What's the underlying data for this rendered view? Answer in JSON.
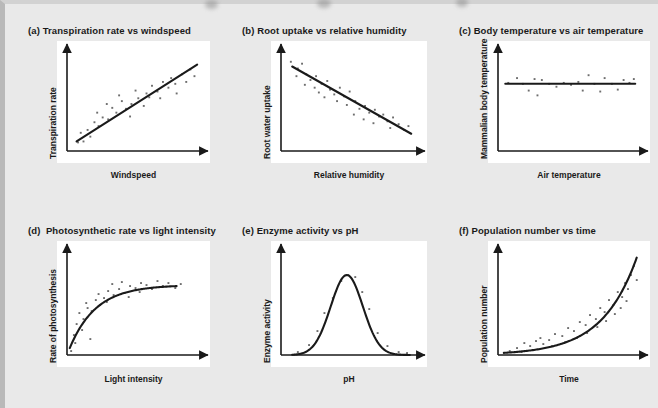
{
  "figure": {
    "background_color": "#e9e9e9",
    "panel_color": "#ffffff",
    "ink_color": "#1a1a1a",
    "point_color": "#6e6e6e"
  },
  "panels": [
    {
      "key": "a",
      "title": "(a) Transpiration rate vs windspeed",
      "xlabel": "Windspeed",
      "ylabel": "Transpiration rate",
      "chart_data": {
        "type": "scatter",
        "title": "(a) Transpiration rate vs windspeed",
        "xlabel": "Windspeed",
        "ylabel": "Transpiration rate",
        "relationship": "positive linear correlation",
        "xlim": [
          0,
          1
        ],
        "ylim": [
          0,
          1
        ],
        "grid": false,
        "legend": "none",
        "fit_line": {
          "type": "linear",
          "x": [
            0.07,
            0.95
          ],
          "y": [
            0.1,
            0.9
          ]
        },
        "points": [
          [
            0.08,
            0.09
          ],
          [
            0.12,
            0.1
          ],
          [
            0.1,
            0.19
          ],
          [
            0.15,
            0.22
          ],
          [
            0.17,
            0.15
          ],
          [
            0.2,
            0.3
          ],
          [
            0.23,
            0.26
          ],
          [
            0.26,
            0.35
          ],
          [
            0.22,
            0.4
          ],
          [
            0.3,
            0.33
          ],
          [
            0.33,
            0.45
          ],
          [
            0.29,
            0.49
          ],
          [
            0.36,
            0.4
          ],
          [
            0.4,
            0.52
          ],
          [
            0.43,
            0.44
          ],
          [
            0.38,
            0.58
          ],
          [
            0.47,
            0.49
          ],
          [
            0.46,
            0.36
          ],
          [
            0.52,
            0.55
          ],
          [
            0.5,
            0.63
          ],
          [
            0.56,
            0.47
          ],
          [
            0.58,
            0.6
          ],
          [
            0.62,
            0.68
          ],
          [
            0.6,
            0.56
          ],
          [
            0.66,
            0.62
          ],
          [
            0.7,
            0.72
          ],
          [
            0.68,
            0.55
          ],
          [
            0.74,
            0.66
          ],
          [
            0.76,
            0.76
          ],
          [
            0.8,
            0.6
          ],
          [
            0.79,
            0.7
          ],
          [
            0.84,
            0.8
          ],
          [
            0.87,
            0.72
          ],
          [
            0.9,
            0.85
          ],
          [
            0.93,
            0.78
          ]
        ]
      }
    },
    {
      "key": "b",
      "title": "(b) Root uptake vs relative humidity",
      "xlabel": "Relative humidity",
      "ylabel": "Root water uptake",
      "chart_data": {
        "type": "scatter",
        "title": "(b) Root uptake vs relative humidity",
        "xlabel": "Relative humidity",
        "ylabel": "Root water uptake",
        "relationship": "negative linear correlation",
        "xlim": [
          0,
          1
        ],
        "ylim": [
          0,
          1
        ],
        "grid": false,
        "legend": "none",
        "fit_line": {
          "type": "linear",
          "x": [
            0.08,
            0.93
          ],
          "y": [
            0.88,
            0.18
          ]
        },
        "points": [
          [
            0.07,
            0.93
          ],
          [
            0.12,
            0.86
          ],
          [
            0.15,
            0.91
          ],
          [
            0.11,
            0.78
          ],
          [
            0.18,
            0.8
          ],
          [
            0.21,
            0.74
          ],
          [
            0.17,
            0.69
          ],
          [
            0.25,
            0.78
          ],
          [
            0.24,
            0.66
          ],
          [
            0.29,
            0.7
          ],
          [
            0.27,
            0.61
          ],
          [
            0.33,
            0.73
          ],
          [
            0.35,
            0.64
          ],
          [
            0.31,
            0.56
          ],
          [
            0.38,
            0.59
          ],
          [
            0.42,
            0.66
          ],
          [
            0.4,
            0.52
          ],
          [
            0.45,
            0.57
          ],
          [
            0.49,
            0.62
          ],
          [
            0.47,
            0.48
          ],
          [
            0.53,
            0.52
          ],
          [
            0.56,
            0.44
          ],
          [
            0.52,
            0.38
          ],
          [
            0.6,
            0.47
          ],
          [
            0.63,
            0.4
          ],
          [
            0.59,
            0.33
          ],
          [
            0.67,
            0.43
          ],
          [
            0.7,
            0.36
          ],
          [
            0.66,
            0.29
          ],
          [
            0.73,
            0.38
          ],
          [
            0.76,
            0.31
          ],
          [
            0.8,
            0.35
          ],
          [
            0.78,
            0.24
          ],
          [
            0.84,
            0.28
          ],
          [
            0.88,
            0.22
          ],
          [
            0.91,
            0.26
          ]
        ]
      }
    },
    {
      "key": "c",
      "title": "(c) Body temperature vs air temperature",
      "xlabel": "Air temperature",
      "ylabel": "Mammalian body temperature",
      "chart_data": {
        "type": "scatter",
        "title": "(c) Body temperature vs air temperature",
        "xlabel": "Air temperature",
        "ylabel": "Mammalian body temperature",
        "relationship": "no correlation (flat line)",
        "xlim": [
          0,
          1
        ],
        "ylim": [
          0,
          1
        ],
        "grid": false,
        "legend": "none",
        "fit_line": {
          "type": "linear",
          "x": [
            0.05,
            0.94
          ],
          "y": [
            0.7,
            0.7
          ]
        },
        "points": [
          [
            0.07,
            0.71
          ],
          [
            0.13,
            0.76
          ],
          [
            0.17,
            0.7
          ],
          [
            0.21,
            0.63
          ],
          [
            0.25,
            0.75
          ],
          [
            0.3,
            0.74
          ],
          [
            0.27,
            0.58
          ],
          [
            0.35,
            0.7
          ],
          [
            0.4,
            0.67
          ],
          [
            0.45,
            0.71
          ],
          [
            0.5,
            0.69
          ],
          [
            0.55,
            0.72
          ],
          [
            0.58,
            0.63
          ],
          [
            0.62,
            0.79
          ],
          [
            0.66,
            0.7
          ],
          [
            0.7,
            0.62
          ],
          [
            0.73,
            0.76
          ],
          [
            0.78,
            0.7
          ],
          [
            0.82,
            0.64
          ],
          [
            0.86,
            0.74
          ],
          [
            0.9,
            0.71
          ],
          [
            0.93,
            0.75
          ]
        ]
      }
    },
    {
      "key": "d",
      "title": "(d)  Photosynthetic rate vs light intensity",
      "xlabel": "Light intensity",
      "ylabel": "Rate of photosynthesis",
      "chart_data": {
        "type": "scatter",
        "title": "(d) Photosynthetic rate vs light intensity",
        "xlabel": "Light intensity",
        "ylabel": "Rate of photosynthesis",
        "relationship": "positive correlation levelling off (saturation curve)",
        "xlim": [
          0,
          1
        ],
        "ylim": [
          0,
          1
        ],
        "grid": false,
        "legend": "none",
        "fit_curve": {
          "type": "saturation",
          "plateau": 0.7,
          "rate": 5.2,
          "x_start": 0.02,
          "x_end": 0.8
        },
        "points": [
          [
            0.03,
            0.04
          ],
          [
            0.05,
            0.2
          ],
          [
            0.07,
            0.31
          ],
          [
            0.06,
            0.12
          ],
          [
            0.09,
            0.42
          ],
          [
            0.12,
            0.36
          ],
          [
            0.11,
            0.25
          ],
          [
            0.15,
            0.47
          ],
          [
            0.14,
            0.52
          ],
          [
            0.18,
            0.44
          ],
          [
            0.17,
            0.16
          ],
          [
            0.21,
            0.55
          ],
          [
            0.24,
            0.5
          ],
          [
            0.23,
            0.61
          ],
          [
            0.27,
            0.57
          ],
          [
            0.3,
            0.64
          ],
          [
            0.29,
            0.53
          ],
          [
            0.34,
            0.6
          ],
          [
            0.33,
            0.71
          ],
          [
            0.38,
            0.66
          ],
          [
            0.42,
            0.62
          ],
          [
            0.4,
            0.73
          ],
          [
            0.46,
            0.69
          ],
          [
            0.45,
            0.58
          ],
          [
            0.5,
            0.67
          ],
          [
            0.54,
            0.72
          ],
          [
            0.53,
            0.63
          ],
          [
            0.58,
            0.7
          ],
          [
            0.62,
            0.66
          ],
          [
            0.66,
            0.74
          ],
          [
            0.7,
            0.69
          ],
          [
            0.74,
            0.72
          ],
          [
            0.79,
            0.67
          ],
          [
            0.83,
            0.71
          ]
        ]
      }
    },
    {
      "key": "e",
      "title": "(e) Enzyme activity vs pH",
      "xlabel": "pH",
      "ylabel": "Enzyme activity",
      "chart_data": {
        "type": "scatter",
        "title": "(e) Enzyme activity vs pH",
        "xlabel": "pH",
        "ylabel": "Enzyme activity",
        "relationship": "optimum curve (bell shaped)",
        "xlim": [
          0,
          1
        ],
        "ylim": [
          0,
          1
        ],
        "grid": false,
        "legend": "none",
        "fit_curve": {
          "type": "gaussian",
          "peak": 0.8,
          "centre": 0.47,
          "width": 0.115,
          "x_start": 0.08,
          "x_end": 0.92
        },
        "points": [
          [
            0.12,
            0.03
          ],
          [
            0.2,
            0.1
          ],
          [
            0.26,
            0.24
          ],
          [
            0.31,
            0.42
          ],
          [
            0.37,
            0.57
          ],
          [
            0.43,
            0.74
          ],
          [
            0.48,
            0.8
          ],
          [
            0.53,
            0.78
          ],
          [
            0.58,
            0.63
          ],
          [
            0.63,
            0.46
          ],
          [
            0.69,
            0.22
          ],
          [
            0.76,
            0.09
          ],
          [
            0.84,
            0.03
          ],
          [
            0.9,
            0.02
          ]
        ]
      }
    },
    {
      "key": "f",
      "title": "(f) Population number vs time",
      "xlabel": "Time",
      "ylabel": "Population number",
      "chart_data": {
        "type": "scatter",
        "title": "(f) Population number vs time",
        "xlabel": "Time",
        "ylabel": "Population number",
        "relationship": "exponential growth",
        "xlim": [
          0,
          1
        ],
        "ylim": [
          0,
          1
        ],
        "grid": false,
        "legend": "none",
        "fit_curve": {
          "type": "exponential",
          "base": 0.018,
          "rate": 4.2,
          "x_start": 0.04,
          "x_end": 0.95
        },
        "points": [
          [
            0.08,
            0.04
          ],
          [
            0.13,
            0.07
          ],
          [
            0.18,
            0.12
          ],
          [
            0.16,
            0.03
          ],
          [
            0.22,
            0.09
          ],
          [
            0.26,
            0.14
          ],
          [
            0.24,
            0.05
          ],
          [
            0.31,
            0.11
          ],
          [
            0.29,
            0.17
          ],
          [
            0.35,
            0.15
          ],
          [
            0.39,
            0.21
          ],
          [
            0.37,
            0.09
          ],
          [
            0.44,
            0.19
          ],
          [
            0.48,
            0.27
          ],
          [
            0.46,
            0.13
          ],
          [
            0.52,
            0.24
          ],
          [
            0.56,
            0.33
          ],
          [
            0.54,
            0.17
          ],
          [
            0.6,
            0.3
          ],
          [
            0.63,
            0.4
          ],
          [
            0.61,
            0.22
          ],
          [
            0.67,
            0.36
          ],
          [
            0.7,
            0.47
          ],
          [
            0.68,
            0.28
          ],
          [
            0.73,
            0.43
          ],
          [
            0.76,
            0.55
          ],
          [
            0.74,
            0.34
          ],
          [
            0.79,
            0.5
          ],
          [
            0.82,
            0.63
          ],
          [
            0.8,
            0.41
          ],
          [
            0.85,
            0.58
          ],
          [
            0.87,
            0.72
          ],
          [
            0.84,
            0.47
          ],
          [
            0.89,
            0.66
          ],
          [
            0.91,
            0.8
          ],
          [
            0.93,
            0.89
          ],
          [
            0.88,
            0.54
          ],
          [
            0.95,
            0.75
          ]
        ]
      }
    }
  ]
}
